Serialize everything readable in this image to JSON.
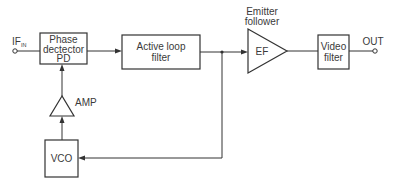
{
  "diagram": {
    "input": {
      "label": "IF",
      "subscript": "IN"
    },
    "output": {
      "label": "OUT"
    },
    "blocks": {
      "phase_detector": {
        "lines": [
          "Phase",
          "dectector",
          "PD"
        ]
      },
      "active_loop_filter": {
        "lines": [
          "Active loop",
          "filter"
        ]
      },
      "emitter_follower": {
        "label": "EF",
        "caption": [
          "Emitter",
          "follower"
        ]
      },
      "video_filter": {
        "lines": [
          "Video",
          "filter"
        ]
      },
      "amp": {
        "label": "AMP"
      },
      "vco": {
        "label": "VCO"
      }
    },
    "connections": [
      "IF_IN -> Phase detector PD",
      "Phase detector PD -> Active loop filter",
      "Active loop filter -> EF",
      "EF -> Video filter",
      "Video filter -> OUT",
      "Active loop filter output (junction) -> VCO",
      "VCO -> AMP",
      "AMP -> Phase detector PD"
    ]
  }
}
